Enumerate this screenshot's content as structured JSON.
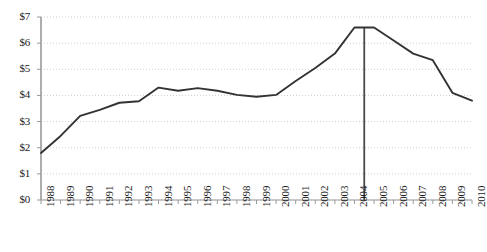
{
  "chart_data": {
    "type": "line",
    "title": "",
    "subtitle": "",
    "xlabel": "",
    "ylabel": "",
    "grid": true,
    "legend": "none",
    "xlim": [
      1988,
      2010
    ],
    "ylim": [
      0,
      7
    ],
    "y_tick_labels": [
      "$7",
      "$6",
      "$5",
      "$4",
      "$3",
      "$2",
      "$1",
      "$0"
    ],
    "y_tick_values": [
      7,
      6,
      5,
      4,
      3,
      2,
      1,
      0
    ],
    "x_tick_labels": [
      "1988",
      "1989",
      "1990",
      "1991",
      "1992",
      "1993",
      "1994",
      "1995",
      "1996",
      "1997",
      "1998",
      "1999",
      "2000",
      "2001",
      "2002",
      "2003",
      "2004",
      "2005",
      "2006",
      "2007",
      "2008",
      "2009",
      "2010"
    ],
    "x": [
      1988,
      1989,
      1990,
      1991,
      1992,
      1993,
      1994,
      1995,
      1996,
      1997,
      1998,
      1999,
      2000,
      2001,
      2002,
      2003,
      2004,
      2005,
      2006,
      2007,
      2008,
      2009,
      2010
    ],
    "values": [
      1.8,
      2.45,
      3.22,
      3.45,
      3.72,
      3.78,
      4.3,
      4.18,
      4.28,
      4.18,
      4.02,
      3.95,
      4.02,
      4.55,
      5.05,
      5.6,
      6.6,
      6.6,
      6.1,
      5.6,
      5.35,
      4.1,
      3.8
    ],
    "series": [
      {
        "name": "value",
        "color": "#333333",
        "values": [
          1.8,
          2.45,
          3.22,
          3.45,
          3.72,
          3.78,
          4.3,
          4.18,
          4.28,
          4.18,
          4.02,
          3.95,
          4.02,
          4.55,
          5.05,
          5.6,
          6.6,
          6.6,
          6.1,
          5.6,
          5.35,
          4.1,
          3.8
        ]
      }
    ],
    "annotations": [
      {
        "type": "vertical-line",
        "name": "reference-line",
        "x": 2004.5,
        "color": "#4a4a4a",
        "label": ""
      }
    ],
    "axis_color": "#9a9a9a",
    "grid_color": "#cfcfcf",
    "line_color": "#333333"
  }
}
